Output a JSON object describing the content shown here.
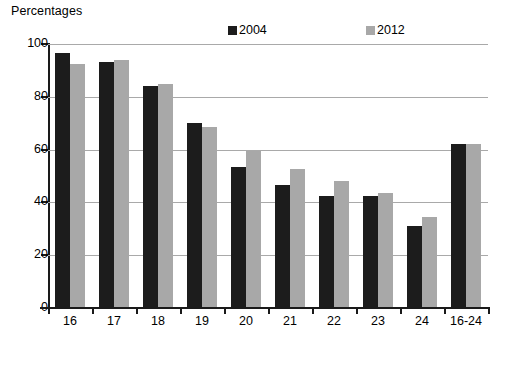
{
  "chart_data": {
    "type": "bar",
    "title": "Percentages",
    "xlabel": "",
    "ylabel": "",
    "categories": [
      "16",
      "17",
      "18",
      "19",
      "20",
      "21",
      "22",
      "23",
      "24",
      "16-24"
    ],
    "series": [
      {
        "name": "2004",
        "color": "#1c1c1c",
        "values": [
          96.5,
          93,
          84,
          70,
          53.5,
          46.5,
          42.5,
          42.5,
          31,
          62
        ]
      },
      {
        "name": "2012",
        "color": "#a8a8a8",
        "values": [
          92.5,
          94,
          84.8,
          68.5,
          59.5,
          52.5,
          48,
          43.5,
          34.5,
          62
        ]
      }
    ],
    "ylim": [
      0,
      100
    ],
    "yticks": [
      0,
      20,
      40,
      60,
      80,
      100
    ],
    "ytick_labels": [
      "0",
      "20",
      "40",
      "60",
      "80",
      "100"
    ],
    "grid": true,
    "grid_axis": "y",
    "legend_position": "top-center",
    "legend_entries": [
      "2004",
      "2012"
    ]
  },
  "colors": {
    "series_2004": "#1c1c1c",
    "series_2012": "#a8a8a8",
    "gridline": "#a9a9a9",
    "axis": "#1a1a1a",
    "background": "#ffffff"
  }
}
